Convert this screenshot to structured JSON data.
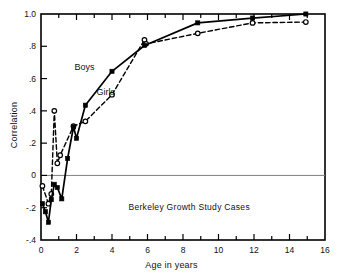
{
  "chart_data": {
    "type": "line",
    "title": "",
    "xlabel": "Age in years",
    "ylabel": "Correlation",
    "xlim": [
      0,
      16
    ],
    "ylim": [
      -0.4,
      1.0
    ],
    "grid": false,
    "legend_position": "inline-annotation",
    "zero_reference_line": true,
    "x_tick_labels": [
      "0",
      "2",
      "4",
      "6",
      "8",
      "10",
      "12",
      "14",
      "16"
    ],
    "x_tick_values": [
      0,
      2,
      4,
      6,
      8,
      10,
      12,
      14,
      16
    ],
    "x_minor_tick_values": [
      1,
      3,
      5,
      7,
      9,
      11,
      13,
      15
    ],
    "y_tick_labels": [
      "1.0",
      ".8",
      ".6",
      ".4",
      ".2",
      "0",
      "-.2",
      "-.4"
    ],
    "y_tick_values": [
      1.0,
      0.8,
      0.6,
      0.4,
      0.2,
      0.0,
      -0.2,
      -0.4
    ],
    "annotations": [
      {
        "text": "Boys",
        "x": 2.45,
        "y": 0.655
      },
      {
        "text": "Girls",
        "x": 3.65,
        "y": 0.5
      },
      {
        "text": "Berkeley Growth Study Cases",
        "x": 8.35,
        "y": -0.215
      }
    ],
    "series": [
      {
        "name": "Boys",
        "line_style": "solid",
        "marker": "filled-square",
        "color": "#000000",
        "points": [
          [
            0.08,
            -0.175
          ],
          [
            0.25,
            -0.225
          ],
          [
            0.42,
            -0.29
          ],
          [
            0.58,
            -0.15
          ],
          [
            0.75,
            -0.055
          ],
          [
            0.92,
            -0.075
          ],
          [
            1.17,
            -0.145
          ],
          [
            1.5,
            0.105
          ],
          [
            1.83,
            0.3
          ],
          [
            2.0,
            0.23
          ],
          [
            2.5,
            0.435
          ],
          [
            4.0,
            0.645
          ],
          [
            5.83,
            0.805
          ],
          [
            8.83,
            0.945
          ],
          [
            11.92,
            0.975
          ],
          [
            14.92,
            1.0
          ]
        ]
      },
      {
        "name": "Girls",
        "line_style": "dashed",
        "marker": "open-circle",
        "color": "#000000",
        "points": [
          [
            0.08,
            -0.065
          ],
          [
            0.42,
            -0.175
          ],
          [
            0.58,
            -0.115
          ],
          [
            0.75,
            0.4
          ],
          [
            0.92,
            0.075
          ],
          [
            1.08,
            0.125
          ],
          [
            1.83,
            0.305
          ],
          [
            2.5,
            0.335
          ],
          [
            4.0,
            0.5
          ],
          [
            5.83,
            0.84
          ],
          [
            5.92,
            0.815
          ],
          [
            8.83,
            0.88
          ],
          [
            11.92,
            0.945
          ],
          [
            14.92,
            0.95
          ]
        ]
      }
    ]
  }
}
